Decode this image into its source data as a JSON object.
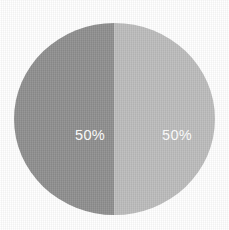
{
  "chart_data": {
    "type": "pie",
    "title": "",
    "xlabel": "",
    "ylabel": "",
    "categories": [
      "Slice 1",
      "Slice 2"
    ],
    "values": [
      50,
      50
    ],
    "value_labels": [
      "50%",
      "50%"
    ],
    "colors": [
      "#8f8f8f",
      "#bcbcbc"
    ],
    "label_color": "#ffffff",
    "background": "#ffffff",
    "legend": "none",
    "grid": false,
    "start_angle_deg": 0,
    "slices": [
      {
        "name": "Slice 1",
        "value": 50,
        "label": "50%",
        "color": "#8f8f8f",
        "position": "left"
      },
      {
        "name": "Slice 2",
        "value": 50,
        "label": "50%",
        "color": "#bcbcbc",
        "position": "right"
      }
    ]
  },
  "figure": {
    "width": 229,
    "height": 230,
    "background": "#ffffff"
  }
}
